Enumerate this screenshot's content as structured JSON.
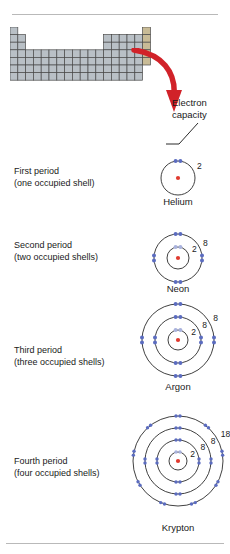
{
  "figure": {
    "callout": {
      "line1": "Electron",
      "line2": "capacity"
    }
  },
  "periodic_table": {
    "highlight_color": "#c8bb96",
    "cell_color": "#b9c0c6",
    "border_color": "#4a4a4a",
    "note": "schematic periodic table with noble-gas column highlighted"
  },
  "arrow": {
    "color": "#d12229"
  },
  "colors": {
    "nucleus": "#e03a2f",
    "electron": "#5b6cc0",
    "electron_light": "#a9b2dd",
    "shell_stroke": "#2b2b2b",
    "text": "#1a1a1a"
  },
  "rows": [
    {
      "period_label": "First period",
      "shell_note": "(one occupied shell)",
      "element": "Helium",
      "shells": [
        2
      ],
      "shell_labels": [
        "2"
      ]
    },
    {
      "period_label": "Second period",
      "shell_note": "(two occupied shells)",
      "element": "Neon",
      "shells": [
        2,
        8
      ],
      "shell_labels": [
        "2",
        "8"
      ]
    },
    {
      "period_label": "Third period",
      "shell_note": "(three occupied shells)",
      "element": "Argon",
      "shells": [
        2,
        8,
        8
      ],
      "shell_labels": [
        "2",
        "8",
        "8"
      ]
    },
    {
      "period_label": "Fourth period",
      "shell_note": "(four occupied shells)",
      "element": "Krypton",
      "shells": [
        2,
        8,
        8,
        18
      ],
      "shell_labels": [
        "2",
        "8",
        "8",
        "18"
      ]
    }
  ]
}
